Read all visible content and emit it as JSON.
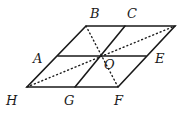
{
  "diagram": {
    "type": "geometry",
    "colors": {
      "line": "#1a1a1a",
      "background": "#ffffff"
    },
    "points": {
      "TL": [
        86,
        26
      ],
      "C": [
        125,
        26
      ],
      "TR": [
        175,
        26
      ],
      "A": [
        58,
        56
      ],
      "O": [
        100,
        56
      ],
      "E": [
        145,
        56
      ],
      "H": [
        27,
        87
      ],
      "G": [
        75,
        87
      ],
      "F": [
        118,
        87
      ]
    },
    "labels": [
      {
        "text": "B",
        "x": 90,
        "y": 18
      },
      {
        "text": "C",
        "x": 127,
        "y": 18
      },
      {
        "text": "A",
        "x": 33,
        "y": 63
      },
      {
        "text": "O",
        "x": 104,
        "y": 69
      },
      {
        "text": "E",
        "x": 155,
        "y": 63
      },
      {
        "text": "H",
        "x": 6,
        "y": 105
      },
      {
        "text": "G",
        "x": 64,
        "y": 105
      },
      {
        "text": "F",
        "x": 114,
        "y": 105
      }
    ]
  }
}
